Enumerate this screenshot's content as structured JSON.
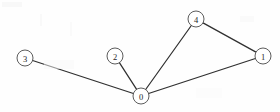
{
  "figure": {
    "width": 280,
    "height": 112,
    "background_color": "#fefefe",
    "node_stroke_color": "#4a4a4a",
    "edge_stroke_color": "#303030",
    "label_color": "#262626",
    "node_radius": 8
  },
  "chart_data": {
    "type": "diagram",
    "title": "",
    "xlabel": "",
    "ylabel": "",
    "graph_kind": "undirected node-link graph",
    "node_count": 5,
    "edge_count": 5,
    "nodes": [
      {
        "id": "0",
        "label": "0",
        "x": 141,
        "y": 96,
        "r": 8,
        "degree": 4
      },
      {
        "id": "1",
        "label": "1",
        "x": 263,
        "y": 56,
        "r": 8,
        "degree": 2
      },
      {
        "id": "2",
        "label": "2",
        "x": 115,
        "y": 56,
        "r": 8,
        "degree": 1
      },
      {
        "id": "3",
        "label": "3",
        "x": 25,
        "y": 58,
        "r": 8,
        "degree": 1
      },
      {
        "id": "4",
        "label": "4",
        "x": 196,
        "y": 19,
        "r": 8,
        "degree": 2
      }
    ],
    "edges": [
      {
        "source": "3",
        "target": "0"
      },
      {
        "source": "2",
        "target": "0"
      },
      {
        "source": "4",
        "target": "0"
      },
      {
        "source": "1",
        "target": "0"
      },
      {
        "source": "4",
        "target": "1"
      }
    ]
  }
}
